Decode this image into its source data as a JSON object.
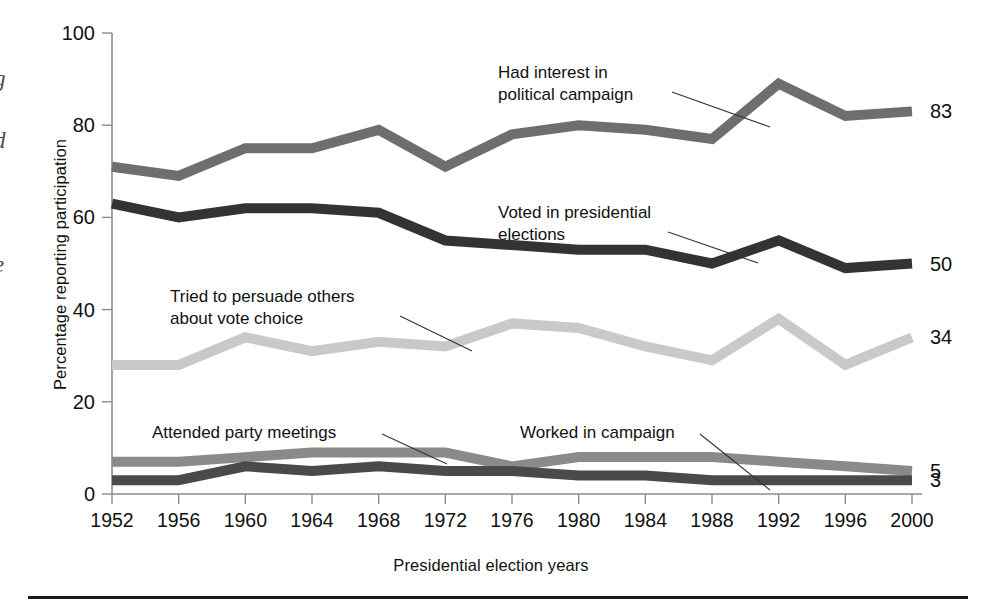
{
  "figure": {
    "margin_fragments": [
      "g",
      "d",
      "e"
    ],
    "xlabel": "Presidential election years",
    "ylabel": "Percentage reporting participation"
  },
  "chart_data": {
    "type": "line",
    "title": "",
    "xlabel": "Presidential election years",
    "ylabel": "Percentage reporting participation",
    "xlim": [
      1952,
      2000
    ],
    "ylim": [
      0,
      100
    ],
    "yticks": [
      0,
      20,
      40,
      60,
      80,
      100
    ],
    "grid": false,
    "legend": "inline-annotations",
    "categories": [
      1952,
      1956,
      1960,
      1964,
      1968,
      1972,
      1976,
      1980,
      1984,
      1988,
      1992,
      1996,
      2000
    ],
    "xtick_labels": [
      "1952",
      "1956",
      "1960",
      "1964",
      "1968",
      "1972",
      "1976",
      "1980",
      "1984",
      "1988",
      "1992",
      "1996",
      "2000"
    ],
    "series": [
      {
        "name": "Had interest in political campaign",
        "color": "#6e6e6e",
        "end_label": "83",
        "values": [
          71,
          69,
          75,
          75,
          79,
          71,
          78,
          80,
          79,
          77,
          89,
          82,
          83
        ]
      },
      {
        "name": "Voted in presidential elections",
        "color": "#333333",
        "end_label": "50",
        "values": [
          63,
          60,
          62,
          62,
          61,
          55,
          54,
          53,
          53,
          50,
          55,
          49,
          50
        ]
      },
      {
        "name": "Tried to persuade others about vote choice",
        "color": "#c9c9c9",
        "end_label": "34",
        "values": [
          28,
          28,
          34,
          31,
          33,
          32,
          37,
          36,
          32,
          29,
          38,
          28,
          34
        ]
      },
      {
        "name": "Attended party meetings",
        "color": "#8a8a8a",
        "end_label": "5",
        "values": [
          7,
          7,
          8,
          9,
          9,
          9,
          6,
          8,
          8,
          8,
          7,
          6,
          5
        ]
      },
      {
        "name": "Worked in campaign",
        "color": "#4a4a4a",
        "end_label": "3",
        "values": [
          3,
          3,
          6,
          5,
          6,
          5,
          5,
          4,
          4,
          3,
          3,
          3,
          3
        ]
      }
    ],
    "annotations": [
      {
        "id": "interest",
        "lines": [
          "Had interest in",
          "political campaign"
        ]
      },
      {
        "id": "voted",
        "lines": [
          "Voted in presidential",
          "elections"
        ]
      },
      {
        "id": "persuade",
        "lines": [
          "Tried to persuade others",
          "about vote choice"
        ]
      },
      {
        "id": "meetings",
        "lines": [
          "Attended party meetings"
        ]
      },
      {
        "id": "worked",
        "lines": [
          "Worked in campaign"
        ]
      }
    ]
  }
}
